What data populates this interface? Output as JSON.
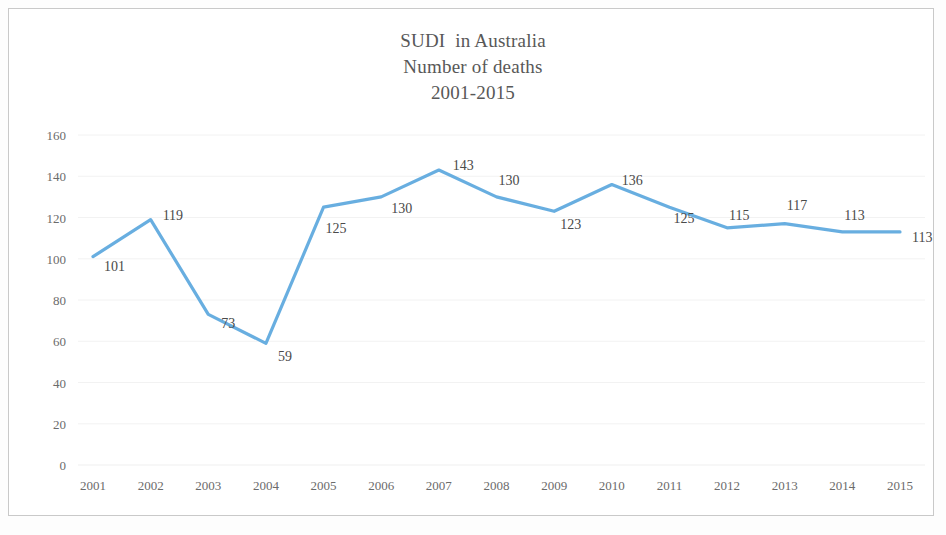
{
  "chart_data": {
    "type": "line",
    "title": "SUDI  in Australia",
    "subtitle": "Number of deaths",
    "subtitle2": "2001-2015",
    "xlabel": "",
    "ylabel": "",
    "categories": [
      "2001",
      "2002",
      "2003",
      "2004",
      "2005",
      "2006",
      "2007",
      "2008",
      "2009",
      "2010",
      "2011",
      "2012",
      "2013",
      "2014",
      "2015"
    ],
    "values": [
      101,
      119,
      73,
      59,
      125,
      130,
      143,
      130,
      123,
      136,
      125,
      115,
      117,
      113,
      113
    ],
    "point_labels": [
      "101",
      "119",
      "73",
      "59",
      "125",
      "130",
      "143",
      "130",
      "123",
      "136",
      "125",
      "115",
      "117",
      "113",
      "113"
    ],
    "ylim": [
      0,
      160
    ],
    "y_ticks": [
      "0",
      "20",
      "40",
      "60",
      "80",
      "100",
      "120",
      "140",
      "160"
    ],
    "grid": true,
    "legend": "none",
    "series_color": "#5BA7DD",
    "text_color": "#6b6b6b",
    "label_color": "#4a4a4a"
  },
  "title_lines": {
    "line1": "SUDI  in Australia",
    "line2": "Number of deaths",
    "line3": "2001-2015"
  }
}
